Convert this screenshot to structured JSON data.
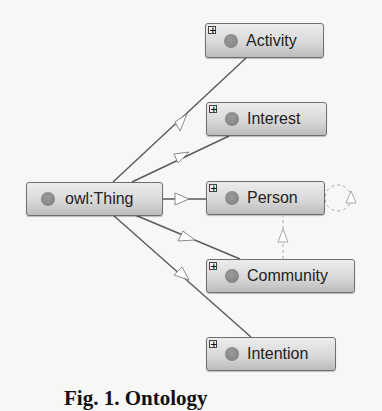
{
  "diagram": {
    "type": "ontology-class-graph",
    "root": {
      "id": "thing",
      "label": "owl:Thing",
      "expandable": false
    },
    "nodes": [
      {
        "id": "activity",
        "label": "Activity",
        "expandable": true
      },
      {
        "id": "interest",
        "label": "Interest",
        "expandable": true
      },
      {
        "id": "person",
        "label": "Person",
        "expandable": true
      },
      {
        "id": "community",
        "label": "Community",
        "expandable": true
      },
      {
        "id": "intention",
        "label": "Intention",
        "expandable": true
      }
    ],
    "edges": [
      {
        "from": "thing",
        "to": "activity",
        "style": "solid",
        "arrow": "open-triangle"
      },
      {
        "from": "thing",
        "to": "interest",
        "style": "solid",
        "arrow": "open-triangle"
      },
      {
        "from": "thing",
        "to": "person",
        "style": "solid",
        "arrow": "open-triangle"
      },
      {
        "from": "thing",
        "to": "community",
        "style": "solid",
        "arrow": "open-triangle"
      },
      {
        "from": "thing",
        "to": "intention",
        "style": "solid",
        "arrow": "open-triangle"
      },
      {
        "from": "community",
        "to": "person",
        "style": "dashed",
        "arrow": "open-triangle"
      },
      {
        "from": "person",
        "to": "person",
        "style": "dashed",
        "arrow": "open-triangle"
      }
    ],
    "expand_icon": "+",
    "colors": {
      "node_border": "#6f6f6f",
      "node_fill_top": "#ececec",
      "node_fill_bottom": "#bcbcbc",
      "dot": "#888888",
      "edge": "#555555",
      "dashed_edge": "#aaaaaa"
    }
  },
  "caption": "Fig. 1. Ontology"
}
